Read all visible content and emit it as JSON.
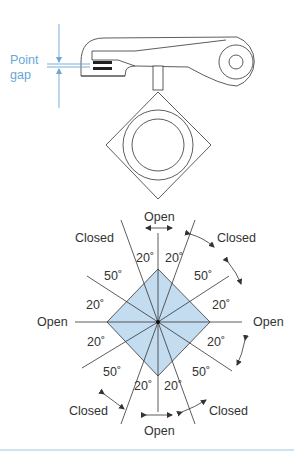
{
  "figure": {
    "top": {
      "point_gap_label_line1": "Point",
      "point_gap_label_line2": "gap"
    },
    "dwell_diagram": {
      "labels": {
        "open_top": "Open",
        "open_bottom": "Open",
        "open_left": "Open",
        "open_right": "Open",
        "closed_top_left": "Closed",
        "closed_top_right": "Closed",
        "closed_bottom_left": "Closed",
        "closed_bottom_right": "Closed"
      },
      "angles": {
        "top_left_20": "20˚",
        "top_right_20": "20˚",
        "upper_left_50": "50˚",
        "upper_right_50": "50˚",
        "left_upper_20": "20˚",
        "right_upper_20": "20˚",
        "left_lower_20": "20˚",
        "right_lower_20": "20˚",
        "lower_left_50": "50˚",
        "lower_right_50": "50˚",
        "bottom_left_20": "20˚",
        "bottom_right_20": "20˚"
      }
    },
    "colors": {
      "accent_blue": "#6aa6d6",
      "fill_blue": "#c4dcf0",
      "line": "#333333"
    }
  }
}
